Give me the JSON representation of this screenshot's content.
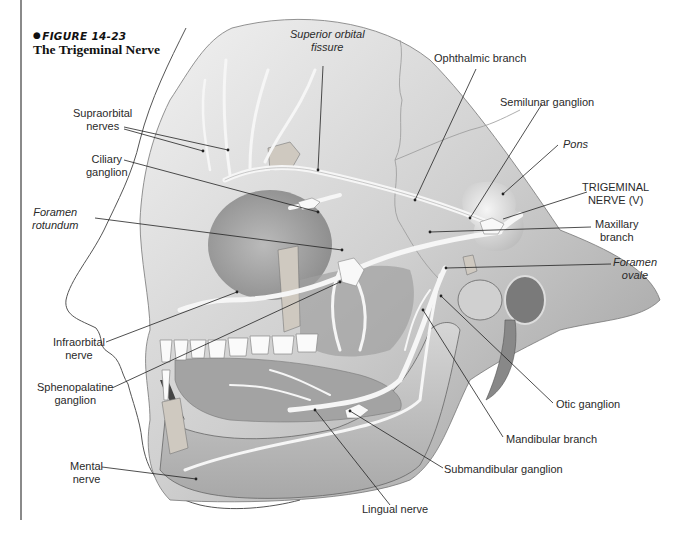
{
  "figure": {
    "number": "FIGURE 14-23",
    "title": "The Trigeminal Nerve"
  },
  "labels": {
    "superior_orbital_fissure": [
      "Superior orbital",
      "fissure"
    ],
    "ophthalmic_branch": "Ophthalmic branch",
    "semilunar_ganglion": "Semilunar ganglion",
    "pons": "Pons",
    "trigeminal_nerve": [
      "TRIGEMINAL",
      "NERVE (V)"
    ],
    "maxillary_branch": [
      "Maxillary",
      "branch"
    ],
    "foramen_ovale": [
      "Foramen",
      "ovale"
    ],
    "supraorbital_nerves": [
      "Supraorbital",
      "nerves"
    ],
    "ciliary_ganglion": [
      "Ciliary",
      "ganglion"
    ],
    "foramen_rotundum": [
      "Foramen",
      "rotundum"
    ],
    "infraorbital_nerve": [
      "Infraorbital",
      "nerve"
    ],
    "sphenopalatine_ganglion": [
      "Sphenopalatine",
      "ganglion"
    ],
    "mental_nerve": [
      "Mental",
      "nerve"
    ],
    "otic_ganglion": "Otic ganglion",
    "mandibular_branch": "Mandibular branch",
    "submandibular_ganglion": "Submandibular ganglion",
    "lingual_nerve": "Lingual nerve"
  },
  "colors": {
    "rule": "#8a8a8a",
    "bone_light": "#e6e6e6",
    "bone_mid": "#bdbdbd",
    "bone_dark": "#8c8c8c",
    "nerve": "#f4f4f4",
    "leader": "#222222"
  }
}
